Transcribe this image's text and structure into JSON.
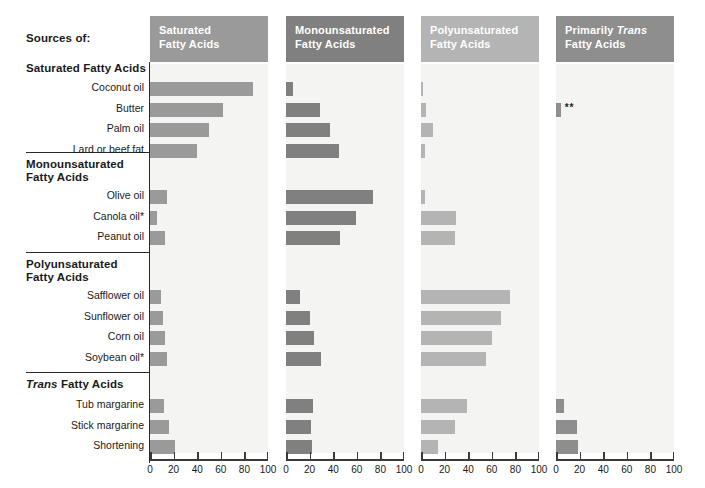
{
  "figure": {
    "faint_top_note": "",
    "faint_bottom_note": "",
    "sources_label": "Sources of:",
    "footnote_marker_single": "*",
    "footnote_marker_double": "**"
  },
  "colors": {
    "panel1": "#9a9a9a",
    "panel2": "#808080",
    "panel3": "#b4b4b4",
    "panel4": "#8e8e8e",
    "plot_bg": "#f4f4f2",
    "rule": "#2b2b2b",
    "axis": "#3a3a3a",
    "text": "#1a1a1a"
  },
  "chart_data": {
    "type": "bar",
    "xlabel": "Percent of total fat",
    "ylabel": "",
    "xlim": [
      0,
      100
    ],
    "xticks": [
      0,
      20,
      40,
      60,
      80,
      100
    ],
    "grid": false,
    "legend": "none",
    "panels": [
      {
        "key": "p1",
        "label_line1": "Saturated",
        "label_line2": "Fatty Acids",
        "label_italic_word": ""
      },
      {
        "key": "p2",
        "label_line1": "Monounsaturated",
        "label_line2": "Fatty Acids",
        "label_italic_word": ""
      },
      {
        "key": "p3",
        "label_line1": "Polyunsaturated",
        "label_line2": "Fatty Acids",
        "label_italic_word": ""
      },
      {
        "key": "p4",
        "label_line1_pre": "Primarily ",
        "label_line1_it": "Trans",
        "label_line2": "Fatty Acids"
      }
    ],
    "groups": [
      {
        "heading_line1": "Saturated Fatty Acids",
        "heading_line2": "",
        "heading_italic_word": "",
        "rows": [
          {
            "label": "Coconut oil",
            "values": [
              87,
              6,
              2,
              0
            ]
          },
          {
            "label": "Butter",
            "values": [
              62,
              29,
              4,
              4
            ]
          },
          {
            "label": "Palm oil",
            "values": [
              50,
              37,
              10,
              0
            ]
          },
          {
            "label": "Lard or beef fat",
            "values": [
              40,
              45,
              3,
              0
            ]
          }
        ]
      },
      {
        "heading_line1": "Monounsaturated",
        "heading_line2": "Fatty Acids",
        "heading_italic_word": "",
        "rows": [
          {
            "label": "Olive oil",
            "values": [
              14,
              74,
              3,
              0
            ]
          },
          {
            "label": "Canola oil*",
            "values": [
              6,
              59,
              30,
              0
            ]
          },
          {
            "label": "Peanut oil",
            "values": [
              13,
              46,
              29,
              0
            ]
          }
        ]
      },
      {
        "heading_line1": "Polyunsaturated",
        "heading_line2": "Fatty Acids",
        "heading_italic_word": "",
        "rows": [
          {
            "label": "Safflower oil",
            "values": [
              9,
              12,
              75,
              0
            ]
          },
          {
            "label": "Sunflower oil",
            "values": [
              11,
              20,
              68,
              0
            ]
          },
          {
            "label": "Corn oil",
            "values": [
              13,
              24,
              60,
              0
            ]
          },
          {
            "label": "Soybean oil*",
            "values": [
              14,
              30,
              55,
              0
            ]
          }
        ]
      },
      {
        "heading_line1": "Trans Fatty Acids",
        "heading_line2": "",
        "heading_italic_word": "Trans",
        "rows": [
          {
            "label": "Tub margarine",
            "values": [
              12,
              23,
              39,
              7
            ]
          },
          {
            "label": "Stick margarine",
            "values": [
              16,
              21,
              29,
              18
            ]
          },
          {
            "label": "Shortening",
            "values": [
              21,
              22,
              14,
              19
            ]
          }
        ]
      }
    ]
  }
}
